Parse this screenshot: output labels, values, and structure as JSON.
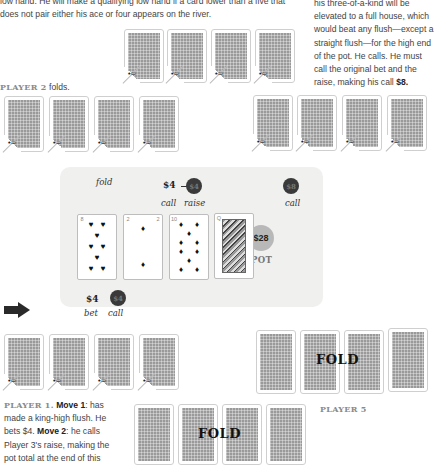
{
  "intro_text": {
    "line1": "low hand. He will make a qualifying low hand if a card lower than a five that",
    "line2": "does not pair either his ace or four appears on the river."
  },
  "player4_text": {
    "lines": [
      "his three-of-a-kind will be",
      "elevated to a full house, which",
      "would beat any flush—except a",
      "straight flush—for the high end",
      "of the pot. He calls. He must",
      "call the original bet and the",
      "raise, making his call "
    ],
    "amount": "$8."
  },
  "player2": {
    "label": "PLAYER 2",
    "action": " folds."
  },
  "player1": {
    "label": "PLAYER 1.",
    "move1_label": "Move 1",
    "move1_text": ": has",
    "line2": "made a king-high flush. He",
    "line3_a": "bets $4. ",
    "move2_label": "Move 2",
    "move2_text": ": he calls",
    "line4": "Player 3's raise, making the",
    "line5": "pot total at the end of this"
  },
  "player5": {
    "label": "PLAYER 5",
    "status": "FOLD"
  },
  "player6": {
    "status": "FOLD"
  },
  "table": {
    "p2_action": "fold",
    "p3": {
      "amount": "$4",
      "chip": "$4",
      "call": "call",
      "raise": "raise"
    },
    "p4": {
      "chip": "$8",
      "call": "call"
    },
    "p1": {
      "amount": "$4",
      "chip": "$4",
      "bet": "bet",
      "call": "call"
    },
    "pot": {
      "amount": "$28",
      "label": "POT"
    }
  },
  "community_cards": [
    {
      "rank": "8",
      "suit": "♥"
    },
    {
      "rank": "2",
      "suit": "♦"
    },
    {
      "rank": "10",
      "suit": "♦"
    },
    {
      "rank": "Q",
      "suit": "♦"
    }
  ],
  "colors": {
    "table_bg": "#f0f0ef",
    "chip_dark": "#3a3a3a",
    "pot_chip": "#b8b8b8",
    "player_label": "#8a8a8a"
  }
}
